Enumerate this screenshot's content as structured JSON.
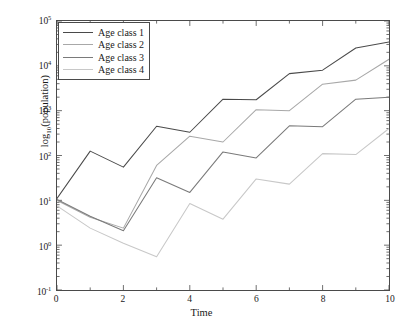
{
  "chart_data": {
    "type": "line",
    "title": "",
    "xlabel": "Time",
    "ylabel": "log10(population)",
    "ylabel_base": "log",
    "ylabel_sub": "10",
    "ylabel_rest": "(population)",
    "xlim": [
      0,
      10
    ],
    "ylim": [
      0.1,
      100000
    ],
    "yscale": "log",
    "grid": false,
    "legend_position": "upper left",
    "xticks": [
      0,
      2,
      4,
      6,
      8,
      10
    ],
    "xticklabels": [
      "0",
      "2",
      "4",
      "6",
      "8",
      "10"
    ],
    "yticks": [
      0.1,
      1,
      10,
      100,
      1000,
      10000,
      100000
    ],
    "yticklabels": [
      "10-1",
      "100",
      "101",
      "102",
      "103",
      "104",
      "105"
    ],
    "ytick_mantissa": "10",
    "ytick_exponents": [
      "-1",
      "0",
      "1",
      "2",
      "3",
      "4",
      "5"
    ],
    "x": [
      0,
      1,
      2,
      3,
      4,
      5,
      6,
      7,
      8,
      9,
      10
    ],
    "series": [
      {
        "name": "Age class  1",
        "color": "#4a4a4a",
        "values": [
          11,
          125,
          55,
          450,
          330,
          1800,
          1750,
          6700,
          8000,
          25000,
          34000
        ]
      },
      {
        "name": "Age class  2",
        "color": "#a8a8a8",
        "values": [
          10,
          4.2,
          2.4,
          60,
          270,
          200,
          1050,
          1000,
          3900,
          4800,
          14000
        ]
      },
      {
        "name": "Age class  3",
        "color": "#7a7a7a",
        "values": [
          10.5,
          4.4,
          2.1,
          32,
          15,
          120,
          88,
          460,
          440,
          1800,
          2000
        ]
      },
      {
        "name": "Age class  4",
        "color": "#c8c8c8",
        "values": [
          7.5,
          2.4,
          1.1,
          0.55,
          8.5,
          3.8,
          30,
          23,
          110,
          105,
          400
        ]
      }
    ]
  },
  "legend": {
    "entries": [
      "Age class  1",
      "Age class  2",
      "Age class  3",
      "Age class  4"
    ]
  }
}
